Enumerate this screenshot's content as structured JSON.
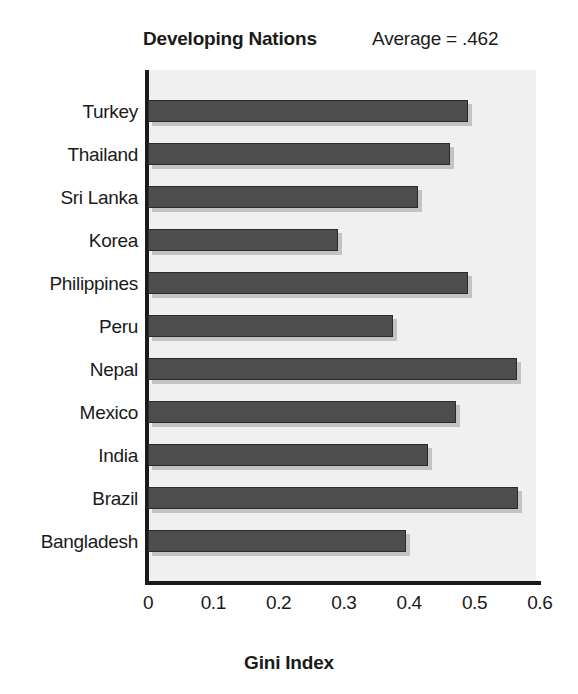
{
  "chart_data": {
    "type": "bar",
    "orientation": "horizontal",
    "title": "Developing Nations",
    "annotation": "Average = .462",
    "xlabel": "Gini Index",
    "ylabel": "",
    "xlim": [
      0,
      0.6
    ],
    "xticks": [
      "0",
      "0.1",
      "0.2",
      "0.3",
      "0.4",
      "0.5",
      "0.6"
    ],
    "xtick_values": [
      0,
      0.1,
      0.2,
      0.3,
      0.4,
      0.5,
      0.6
    ],
    "grid": false,
    "legend": null,
    "average": 0.462,
    "categories": [
      "Turkey",
      "Thailand",
      "Sri Lanka",
      "Korea",
      "Philippines",
      "Peru",
      "Nepal",
      "Mexico",
      "India",
      "Brazil",
      "Bangladesh"
    ],
    "values": [
      0.49,
      0.462,
      0.413,
      0.291,
      0.49,
      0.375,
      0.565,
      0.471,
      0.429,
      0.567,
      0.395
    ],
    "bars": [
      {
        "label": "Turkey",
        "value": 0.49
      },
      {
        "label": "Thailand",
        "value": 0.462
      },
      {
        "label": "Sri Lanka",
        "value": 0.413
      },
      {
        "label": "Korea",
        "value": 0.291
      },
      {
        "label": "Philippines",
        "value": 0.49
      },
      {
        "label": "Peru",
        "value": 0.375
      },
      {
        "label": "Nepal",
        "value": 0.565
      },
      {
        "label": "Mexico",
        "value": 0.471
      },
      {
        "label": "India",
        "value": 0.429
      },
      {
        "label": "Brazil",
        "value": 0.567
      },
      {
        "label": "Bangladesh",
        "value": 0.395
      }
    ],
    "colors": {
      "bar_fill": "#4d4d4d",
      "bar_edge": "#2b2b2b",
      "bar_shadow": "#c3c3c3",
      "plot_background": "#f0f0f0",
      "page_background": "#ffffff",
      "axis": "#1a1a1a",
      "text": "#1a1a1a"
    }
  }
}
